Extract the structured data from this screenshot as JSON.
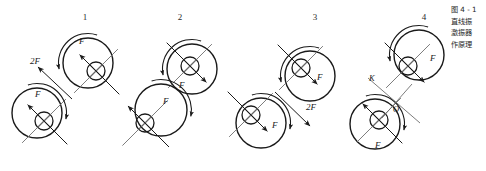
{
  "figure": {
    "title_caption": [
      "图 4 - 1",
      "直线振",
      "激振器",
      "作原理"
    ],
    "group_numbers": [
      "1",
      "2",
      "3",
      "4"
    ],
    "labels": {
      "force": "F",
      "double_force": "2F",
      "axis_k": "K",
      "axis_o": "O"
    }
  },
  "chart_data": {
    "type": "diagram",
    "groups": [
      {
        "number": "1",
        "number_x": 85,
        "number_y": 12,
        "rotors": [
          {
            "cx": 88,
            "cy": 63,
            "r": 25,
            "hub_cx": 96,
            "hub_cy": 71,
            "hub_r": 9,
            "force_label": "F",
            "force_label_x": 79,
            "force_label_y": 44,
            "force_angle_deg": 225,
            "spin": "ccw"
          },
          {
            "cx": 37,
            "cy": 113,
            "r": 25,
            "hub_cx": 44,
            "hub_cy": 121,
            "hub_r": 9,
            "force_label": "F",
            "force_label_x": 35,
            "force_label_y": 97,
            "force_angle_deg": 225,
            "spin": "cw"
          }
        ],
        "resultant": {
          "label": "2F",
          "label_x": 30,
          "label_y": 64,
          "x1": 72,
          "y1": 99,
          "x2": 38,
          "y2": 67,
          "arrow_at": "end"
        }
      },
      {
        "number": "2",
        "number_x": 180,
        "number_y": 12,
        "rotors": [
          {
            "cx": 192,
            "cy": 69,
            "r": 25,
            "hub_cx": 190,
            "hub_cy": 66,
            "hub_r": 9,
            "force_label": "F",
            "force_label_x": 179,
            "force_label_y": 88,
            "force_angle_deg": 45,
            "spin": "ccw"
          },
          {
            "cx": 161,
            "cy": 110,
            "r": 26,
            "hub_cx": 145,
            "hub_cy": 123,
            "hub_r": 9,
            "force_label": "F",
            "force_label_x": 163,
            "force_label_y": 104,
            "force_angle_deg": 225,
            "spin": "cw"
          }
        ],
        "resultant": null
      },
      {
        "number": "3",
        "number_x": 315,
        "number_y": 12,
        "rotors": [
          {
            "cx": 310,
            "cy": 76,
            "r": 25,
            "hub_cx": 301,
            "hub_cy": 68,
            "hub_r": 9,
            "force_label": "F",
            "force_label_x": 317,
            "force_label_y": 80,
            "force_angle_deg": 45,
            "spin": "ccw"
          },
          {
            "cx": 261,
            "cy": 123,
            "r": 25,
            "hub_cx": 251,
            "hub_cy": 115,
            "hub_r": 9,
            "force_label": "F",
            "force_label_x": 272,
            "force_label_y": 128,
            "force_angle_deg": 45,
            "spin": "cw"
          }
        ],
        "resultant": {
          "label": "2F",
          "label_x": 306,
          "label_y": 110,
          "x1": 275,
          "y1": 92,
          "x2": 310,
          "y2": 126,
          "arrow_at": "end"
        }
      },
      {
        "number": "4",
        "number_x": 424,
        "number_y": 12,
        "rotors": [
          {
            "cx": 419,
            "cy": 55,
            "r": 25,
            "hub_cx": 408,
            "hub_cy": 66,
            "hub_r": 9,
            "force_label": "F",
            "force_label_x": 430,
            "force_label_y": 61,
            "force_angle_deg": 45,
            "spin": "ccw"
          },
          {
            "cx": 375,
            "cy": 124,
            "r": 25,
            "hub_cx": 379,
            "hub_cy": 120,
            "hub_r": 9,
            "force_label": "F",
            "force_label_x": 375,
            "force_label_y": 148,
            "force_angle_deg": 225,
            "spin": "cw"
          }
        ],
        "axis": {
          "k_label": "K",
          "k_x": 369,
          "k_y": 81,
          "o_label": "O",
          "o_x": 393,
          "o_y": 112,
          "cx": 396,
          "cy": 102
        }
      }
    ]
  }
}
